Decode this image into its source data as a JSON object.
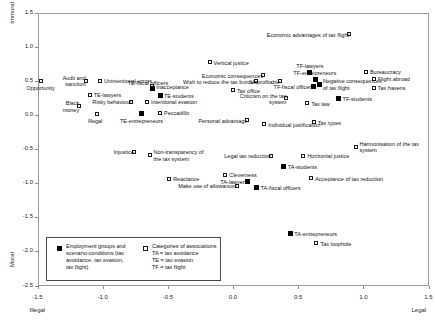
{
  "chart_data": {
    "type": "scatter",
    "title": "",
    "xlabel": "",
    "ylabel": "",
    "xlim": [
      -1.5,
      1.5
    ],
    "ylim": [
      -2.5,
      1.5
    ],
    "grid": false,
    "x_ticks": [
      "-1.5",
      "-1.0",
      "-0.5",
      "0.0",
      "0.5",
      "1.0",
      "1.5"
    ],
    "x_tick_values": [
      -1.5,
      -1.0,
      -0.5,
      0.0,
      0.5,
      1.0,
      1.5
    ],
    "y_ticks": [
      "1.5",
      "1.0",
      "0.5",
      "0.0",
      "-0.5",
      "-1.0",
      "-1.5",
      "-2.0",
      "-2.5"
    ],
    "y_tick_values": [
      1.5,
      1.0,
      0.5,
      0.0,
      -0.5,
      -1.0,
      -1.5,
      -2.0,
      -2.5
    ],
    "axis_endpoint_labels": {
      "y_top": "Immoral",
      "y_bottom": "Moral",
      "x_left": "Illegal",
      "x_right": "Legal"
    },
    "legend": {
      "position": "inside-bottom-left",
      "entries": [
        {
          "marker": "filled-square",
          "text": "Employment groups and\nscenario-conditions (tax\navoidance, tax evasion,\ntax flight)"
        },
        {
          "marker": "open-square",
          "text": "Categories of associations\nTA = tax avoidance\nTE = tax evasion\nTF = tax flight"
        }
      ]
    },
    "series": [
      {
        "name": "Categories of associations",
        "marker": "open-square",
        "points": [
          {
            "label": "Opportunity",
            "x": -1.47,
            "y": 0.5,
            "anchor": "below"
          },
          {
            "label": "Audit and\nsanction",
            "x": -1.13,
            "y": 0.5,
            "anchor": "left"
          },
          {
            "label": "Unintentional errors",
            "x": -1.02,
            "y": 0.5,
            "anchor": "right"
          },
          {
            "label": "TE-lawyers",
            "x": -1.1,
            "y": 0.29,
            "anchor": "right"
          },
          {
            "label": "Black\nmoney",
            "x": -1.18,
            "y": 0.13,
            "anchor": "left"
          },
          {
            "label": "Risky behaviour",
            "x": -0.78,
            "y": 0.19,
            "anchor": "left"
          },
          {
            "label": "Illegal",
            "x": -1.04,
            "y": 0.02,
            "anchor": "below"
          },
          {
            "label": "Inacceptance",
            "x": -0.62,
            "y": 0.42,
            "anchor": "right"
          },
          {
            "label": "Intentional evasion",
            "x": -0.66,
            "y": 0.19,
            "anchor": "right"
          },
          {
            "label": "Vertical justice",
            "x": -0.18,
            "y": 0.77,
            "anchor": "right"
          },
          {
            "label": "Tax office",
            "x": 0.0,
            "y": 0.36,
            "anchor": "right"
          },
          {
            "label": "Economic consequences",
            "x": 0.23,
            "y": 0.58,
            "anchor": "left"
          },
          {
            "label": "Wish to reduce the tax burden",
            "x": 0.18,
            "y": 0.49,
            "anchor": "left"
          },
          {
            "label": "Unprofitable",
            "x": 0.36,
            "y": 0.49,
            "anchor": "left"
          },
          {
            "label": "Economic advantages of tax flight",
            "x": 0.89,
            "y": 1.18,
            "anchor": "left"
          },
          {
            "label": "Bureaucracy",
            "x": 1.02,
            "y": 0.63,
            "anchor": "right"
          },
          {
            "label": "Flight abroad",
            "x": 1.08,
            "y": 0.53,
            "anchor": "right"
          },
          {
            "label": "Tax havens",
            "x": 1.08,
            "y": 0.4,
            "anchor": "right"
          },
          {
            "label": "Criticism on the tax\nsystem",
            "x": 0.41,
            "y": 0.24,
            "anchor": "left"
          },
          {
            "label": "Tax law",
            "x": 0.57,
            "y": 0.17,
            "anchor": "right"
          },
          {
            "label": "Personal advantage",
            "x": 0.11,
            "y": -0.08,
            "anchor": "left"
          },
          {
            "label": "Individual justification",
            "x": 0.24,
            "y": -0.14,
            "anchor": "right"
          },
          {
            "label": "Tax types",
            "x": 0.62,
            "y": -0.11,
            "anchor": "right"
          },
          {
            "label": "Injustice",
            "x": -0.76,
            "y": -0.54,
            "anchor": "left"
          },
          {
            "label": "Non-transparency of\nthe tax system",
            "x": -0.64,
            "y": -0.59,
            "anchor": "right"
          },
          {
            "label": "Legal tax reduction",
            "x": 0.29,
            "y": -0.6,
            "anchor": "left"
          },
          {
            "label": "Horizontal justice",
            "x": 0.54,
            "y": -0.6,
            "anchor": "right"
          },
          {
            "label": "Harmonisation of the tax\nsystem",
            "x": 0.94,
            "y": -0.47,
            "anchor": "right"
          },
          {
            "label": "Reactance",
            "x": -0.49,
            "y": -0.94,
            "anchor": "right"
          },
          {
            "label": "Cleverness",
            "x": -0.06,
            "y": -0.88,
            "anchor": "right"
          },
          {
            "label": "Acceptance of tax reduction",
            "x": 0.6,
            "y": -0.93,
            "anchor": "right"
          },
          {
            "label": "Make use of allowances",
            "x": 0.03,
            "y": -1.04,
            "anchor": "left"
          },
          {
            "label": "Tax loophole",
            "x": 0.64,
            "y": -1.88,
            "anchor": "right"
          },
          {
            "label": "Peccadillo",
            "x": -0.56,
            "y": 0.03,
            "anchor": "right"
          }
        ]
      },
      {
        "name": "Employment groups and scenario-conditions",
        "marker": "filled-square",
        "points": [
          {
            "label": "TE-fiscal officers",
            "x": -0.62,
            "y": 0.38,
            "anchor": "above"
          },
          {
            "label": "TE-students",
            "x": -0.56,
            "y": 0.28,
            "anchor": "right"
          },
          {
            "label": "TE-entrepreneurs",
            "x": -0.7,
            "y": 0.02,
            "anchor": "below"
          },
          {
            "label": "TF-lawyers",
            "x": 0.59,
            "y": 0.62,
            "anchor": "above"
          },
          {
            "label": "TF-entrepreneurs",
            "x": 0.63,
            "y": 0.52,
            "anchor": "above"
          },
          {
            "label": "TF-fiscal officers",
            "x": 0.62,
            "y": 0.42,
            "anchor": "left"
          },
          {
            "label": "Negative consequences\nof tax flight",
            "x": 0.66,
            "y": 0.45,
            "anchor": "right"
          },
          {
            "label": "TF-students",
            "x": 0.81,
            "y": 0.24,
            "anchor": "right"
          },
          {
            "label": "TA-students",
            "x": 0.39,
            "y": -0.76,
            "anchor": "right"
          },
          {
            "label": "TA-lawyers",
            "x": 0.11,
            "y": -0.98,
            "anchor": "left"
          },
          {
            "label": "TA-fiscal officers",
            "x": 0.18,
            "y": -1.06,
            "anchor": "right"
          },
          {
            "label": "TA-entrepreneurs",
            "x": 0.44,
            "y": -1.74,
            "anchor": "right"
          }
        ]
      }
    ]
  },
  "colors": {
    "frame": "#9a9a9a",
    "marker_outline": "#1a1a1a",
    "marker_fill": "#000000",
    "text": "#111111",
    "legend_border": "#4a4a4a",
    "background": "#ffffff"
  }
}
